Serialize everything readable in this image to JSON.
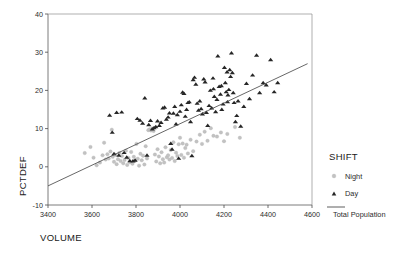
{
  "chart_data": {
    "type": "scatter",
    "title": "",
    "xlabel": "VOLUME",
    "ylabel": "PCTDEF",
    "xlim": [
      3400,
      4600
    ],
    "ylim": [
      -10,
      40
    ],
    "xticks": [
      3400,
      3600,
      3800,
      4000,
      4200,
      4400,
      4600
    ],
    "yticks": [
      -10,
      0,
      10,
      20,
      30,
      40
    ],
    "grid": false,
    "legend_position": "right",
    "legend_title": "SHIFT",
    "series": [
      {
        "name": "Night",
        "marker": "circle",
        "color": "#c2c2c2",
        "points": [
          [
            3567,
            3.6
          ],
          [
            3593,
            5.2
          ],
          [
            3607,
            2.4
          ],
          [
            3621,
            0.4
          ],
          [
            3636,
            1.1
          ],
          [
            3648,
            3.0
          ],
          [
            3655,
            6.3
          ],
          [
            3662,
            1.9
          ],
          [
            3670,
            3.3
          ],
          [
            3676,
            2.2
          ],
          [
            3684,
            4.0
          ],
          [
            3690,
            9.7
          ],
          [
            3694,
            2.6
          ],
          [
            3700,
            1.3
          ],
          [
            3706,
            3.1
          ],
          [
            3712,
            0.7
          ],
          [
            3718,
            2.0
          ],
          [
            3724,
            3.6
          ],
          [
            3730,
            1.5
          ],
          [
            3736,
            2.8
          ],
          [
            3742,
            0.9
          ],
          [
            3748,
            1.8
          ],
          [
            3754,
            4.2
          ],
          [
            3760,
            0.5
          ],
          [
            3766,
            2.3
          ],
          [
            3772,
            1.2
          ],
          [
            3778,
            3.9
          ],
          [
            3784,
            0.8
          ],
          [
            3790,
            2.6
          ],
          [
            3796,
            1.6
          ],
          [
            3802,
            6.0
          ],
          [
            3808,
            2.1
          ],
          [
            3814,
            0.3
          ],
          [
            3820,
            3.4
          ],
          [
            3826,
            1.7
          ],
          [
            3832,
            2.9
          ],
          [
            3838,
            0.6
          ],
          [
            3844,
            5.4
          ],
          [
            3850,
            2.2
          ],
          [
            3856,
            9.6
          ],
          [
            3862,
            9.8
          ],
          [
            3868,
            9.5
          ],
          [
            3874,
            10.0
          ],
          [
            3880,
            9.4
          ],
          [
            3886,
            3.2
          ],
          [
            3892,
            1.4
          ],
          [
            3898,
            4.6
          ],
          [
            3904,
            2.7
          ],
          [
            3910,
            0.9
          ],
          [
            3916,
            3.8
          ],
          [
            3922,
            2.0
          ],
          [
            3928,
            1.1
          ],
          [
            3934,
            5.1
          ],
          [
            3940,
            2.5
          ],
          [
            3946,
            3.0
          ],
          [
            3952,
            1.9
          ],
          [
            3958,
            4.4
          ],
          [
            3964,
            2.3
          ],
          [
            3970,
            6.4
          ],
          [
            3976,
            1.5
          ],
          [
            3982,
            3.7
          ],
          [
            3988,
            2.8
          ],
          [
            3994,
            5.9
          ],
          [
            4000,
            7.6
          ],
          [
            4006,
            3.1
          ],
          [
            4012,
            6.1
          ],
          [
            4018,
            2.4
          ],
          [
            4024,
            4.9
          ],
          [
            4030,
            5.8
          ],
          [
            4036,
            3.5
          ],
          [
            4048,
            7.1
          ],
          [
            4060,
            4.1
          ],
          [
            4075,
            6.6
          ],
          [
            4090,
            8.4
          ],
          [
            4100,
            6.0
          ],
          [
            4112,
            9.2
          ],
          [
            4125,
            6.8
          ],
          [
            4140,
            10.1
          ],
          [
            4152,
            8.1
          ],
          [
            4168,
            7.9
          ],
          [
            4186,
            9.0
          ],
          [
            4200,
            6.7
          ],
          [
            4215,
            8.6
          ],
          [
            4250,
            10.4
          ],
          [
            4272,
            7.6
          ]
        ]
      },
      {
        "name": "Day",
        "marker": "triangle",
        "color": "#262626",
        "points": [
          [
            3680,
            13.5
          ],
          [
            3692,
            9.0
          ],
          [
            3700,
            3.4
          ],
          [
            3712,
            14.2
          ],
          [
            3722,
            3.0
          ],
          [
            3735,
            14.3
          ],
          [
            3746,
            3.7
          ],
          [
            3758,
            2.5
          ],
          [
            3772,
            1.6
          ],
          [
            3786,
            1.5
          ],
          [
            3796,
            1.7
          ],
          [
            3806,
            12.6
          ],
          [
            3818,
            12.2
          ],
          [
            3830,
            11.4
          ],
          [
            3840,
            18.0
          ],
          [
            3850,
            3.0
          ],
          [
            3858,
            11.0
          ],
          [
            3866,
            12.1
          ],
          [
            3874,
            9.9
          ],
          [
            3882,
            10.2
          ],
          [
            3890,
            10.5
          ],
          [
            3898,
            12.0
          ],
          [
            3906,
            10.8
          ],
          [
            3914,
            11.6
          ],
          [
            3922,
            15.4
          ],
          [
            3930,
            15.6
          ],
          [
            3938,
            12.4
          ],
          [
            3946,
            13.0
          ],
          [
            3952,
            14.1
          ],
          [
            3958,
            6.1
          ],
          [
            3964,
            4.6
          ],
          [
            3970,
            14.0
          ],
          [
            3976,
            15.8
          ],
          [
            3982,
            11.2
          ],
          [
            3988,
            13.6
          ],
          [
            3994,
            2.2
          ],
          [
            4000,
            14.5
          ],
          [
            4006,
            16.2
          ],
          [
            4012,
            19.5
          ],
          [
            4018,
            19.2
          ],
          [
            4024,
            13.2
          ],
          [
            4030,
            15.0
          ],
          [
            4036,
            16.8
          ],
          [
            4042,
            17.0
          ],
          [
            4048,
            11.8
          ],
          [
            4054,
            2.9
          ],
          [
            4060,
            22.8
          ],
          [
            4066,
            23.4
          ],
          [
            4072,
            21.6
          ],
          [
            4078,
            16.6
          ],
          [
            4084,
            14.8
          ],
          [
            4090,
            17.2
          ],
          [
            4096,
            15.2
          ],
          [
            4102,
            13.8
          ],
          [
            4108,
            23.0
          ],
          [
            4114,
            22.2
          ],
          [
            4120,
            14.2
          ],
          [
            4126,
            10.8
          ],
          [
            4132,
            16.0
          ],
          [
            4138,
            20.0
          ],
          [
            4144,
            15.4
          ],
          [
            4150,
            23.2
          ],
          [
            4156,
            18.4
          ],
          [
            4162,
            14.4
          ],
          [
            4168,
            17.6
          ],
          [
            4172,
            29.0
          ],
          [
            4178,
            21.0
          ],
          [
            4184,
            19.0
          ],
          [
            4190,
            15.0
          ],
          [
            4196,
            16.4
          ],
          [
            4202,
            26.0
          ],
          [
            4206,
            22.0
          ],
          [
            4210,
            19.6
          ],
          [
            4214,
            24.8
          ],
          [
            4218,
            18.8
          ],
          [
            4222,
            20.2
          ],
          [
            4226,
            25.4
          ],
          [
            4230,
            23.6
          ],
          [
            4234,
            29.8
          ],
          [
            4238,
            24.6
          ],
          [
            4242,
            19.4
          ],
          [
            4246,
            16.8
          ],
          [
            4252,
            11.8
          ],
          [
            4258,
            13.4
          ],
          [
            4264,
            17.2
          ],
          [
            4276,
            10.6
          ],
          [
            4290,
            15.8
          ],
          [
            4302,
            21.8
          ],
          [
            4316,
            17.8
          ],
          [
            4330,
            24.0
          ],
          [
            4348,
            29.2
          ],
          [
            4362,
            19.4
          ],
          [
            4378,
            22.0
          ],
          [
            4392,
            21.4
          ],
          [
            4412,
            28.0
          ],
          [
            4428,
            19.6
          ],
          [
            4444,
            22.0
          ],
          [
            4152,
            20.4
          ],
          [
            4188,
            21.2
          ],
          [
            4216,
            17.0
          ]
        ]
      }
    ],
    "fit_line": {
      "name": "Total Population",
      "color": "#4c4c4c",
      "x_start": 3400,
      "y_start": -5.0,
      "x_end": 4580,
      "y_end": 27.0
    }
  },
  "legend": {
    "title": "SHIFT",
    "entries": [
      {
        "label": "Night",
        "marker": "circle"
      },
      {
        "label": "Day",
        "marker": "triangle"
      },
      {
        "label": "Total Population",
        "marker": "line"
      }
    ]
  }
}
